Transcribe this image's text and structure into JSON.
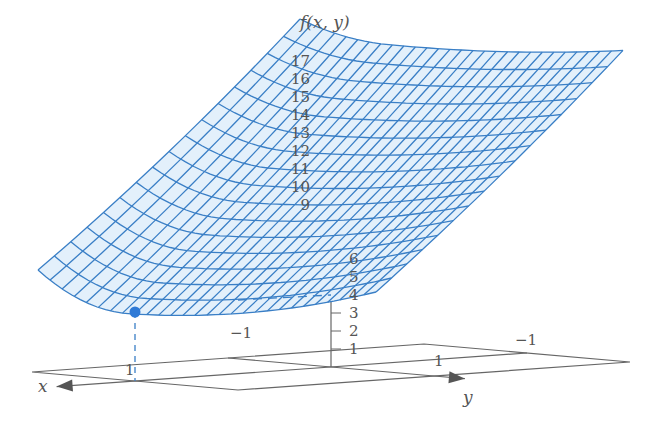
{
  "chart_data": {
    "type": "surface",
    "title": "",
    "function_label": "f(x, y)",
    "xlabel": "x",
    "ylabel": "y",
    "zlabel": "f(x, y)",
    "z_ticks": [
      1,
      2,
      3,
      4,
      5,
      6,
      9,
      10,
      11,
      12,
      13,
      14,
      15,
      16,
      17
    ],
    "x_ticks": [
      {
        "value": 1,
        "label": "1"
      },
      {
        "value": -1,
        "label": "−1"
      }
    ],
    "y_ticks": [
      {
        "value": 1,
        "label": "1"
      },
      {
        "value": -1,
        "label": "−1"
      }
    ],
    "xy_plane_range": {
      "x": [
        -1,
        1
      ],
      "y": [
        -1,
        1
      ]
    },
    "marked_point": {
      "x": 1,
      "y": 0,
      "z": 4
    },
    "surface_color": "#3a7fc6",
    "surface_fill": "#e3f0fb",
    "axis_color": "#666666",
    "mesh": {
      "u_lines": 28,
      "v_lines": 16
    }
  }
}
